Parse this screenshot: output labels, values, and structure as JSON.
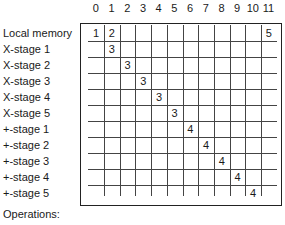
{
  "diagram": {
    "column_headers": [
      "0",
      "1",
      "2",
      "3",
      "4",
      "5",
      "6",
      "7",
      "8",
      "9",
      "10",
      "11"
    ],
    "rows": [
      {
        "label": "Local memory",
        "cells": {
          "0": "1",
          "1": "2",
          "11": "5"
        }
      },
      {
        "label": "X-stage 1",
        "cells": {
          "1": "3"
        }
      },
      {
        "label": "X-stage 2",
        "cells": {
          "2": "3"
        }
      },
      {
        "label": "X-stage 3",
        "cells": {
          "3": "3"
        }
      },
      {
        "label": "X-stage 4",
        "cells": {
          "4": "3"
        }
      },
      {
        "label": "X-stage 5",
        "cells": {
          "5": "3"
        }
      },
      {
        "label": "+-stage 1",
        "cells": {
          "6": "4"
        }
      },
      {
        "label": "+-stage 2",
        "cells": {
          "7": "4"
        }
      },
      {
        "label": "+-stage 3",
        "cells": {
          "8": "4"
        }
      },
      {
        "label": "+-stage 4",
        "cells": {
          "9": "4"
        }
      },
      {
        "label": "+-stage 5",
        "cells": {
          "10": "4"
        }
      }
    ],
    "footer_label": "Operations:"
  }
}
